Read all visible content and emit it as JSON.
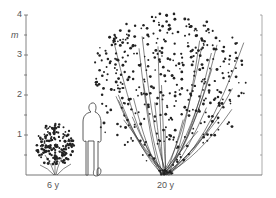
{
  "diagram": {
    "type": "plant-size-comparison",
    "axis": {
      "unit": "m",
      "ticks": [
        "1",
        "2",
        "3",
        "4"
      ],
      "min": 0,
      "max": 4
    },
    "specimens": [
      {
        "label": "6 y",
        "height_m": 1.0,
        "width_m": 1.0
      },
      {
        "label": "20 y",
        "height_m": 4.0,
        "width_m": 3.9
      }
    ],
    "reference": {
      "name": "human figure",
      "height_m": 1.8
    },
    "colors": {
      "ink": "#222222",
      "axis": "#666666",
      "background": "#ffffff"
    }
  }
}
